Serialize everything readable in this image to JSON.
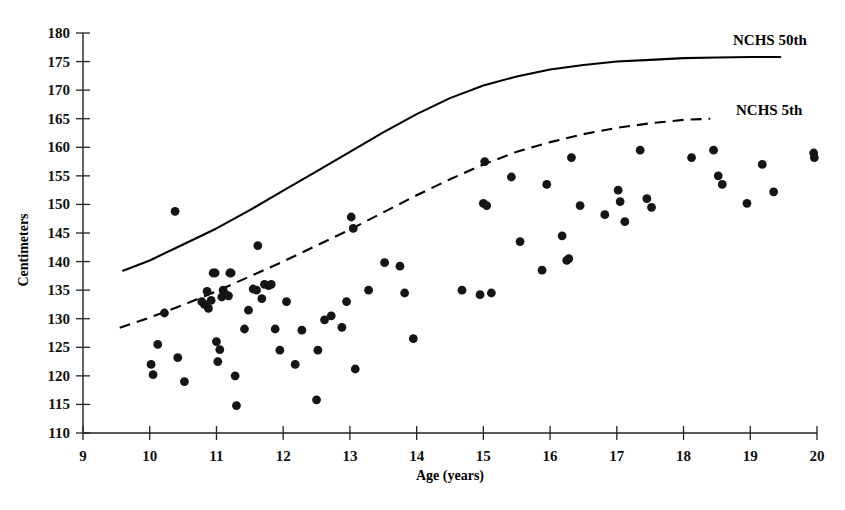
{
  "chart_data": {
    "type": "scatter",
    "title": "",
    "xlabel": "Age (years)",
    "ylabel": "Centimeters",
    "xlim": [
      9,
      20
    ],
    "ylim": [
      110,
      180
    ],
    "xticks": [
      9,
      10,
      11,
      12,
      13,
      14,
      15,
      16,
      17,
      18,
      19,
      20
    ],
    "yticks": [
      110,
      115,
      120,
      125,
      130,
      135,
      140,
      145,
      150,
      155,
      160,
      165,
      170,
      175,
      180
    ],
    "grid": false,
    "legend_position": "inline-right-end-of-curve",
    "marker_color": "#151515",
    "line_color": "#000000",
    "series": [
      {
        "name": "Subjects",
        "type": "scatter",
        "points": [
          [
            10.02,
            122.0
          ],
          [
            10.05,
            120.2
          ],
          [
            10.12,
            125.5
          ],
          [
            10.22,
            131.0
          ],
          [
            10.38,
            148.8
          ],
          [
            10.42,
            123.2
          ],
          [
            10.52,
            119.0
          ],
          [
            10.78,
            133.0
          ],
          [
            10.82,
            132.5
          ],
          [
            10.86,
            134.8
          ],
          [
            10.88,
            131.8
          ],
          [
            10.92,
            133.2
          ],
          [
            10.95,
            138.0
          ],
          [
            10.98,
            138.0
          ],
          [
            11.0,
            126.0
          ],
          [
            11.02,
            122.5
          ],
          [
            11.05,
            124.6
          ],
          [
            11.08,
            133.8
          ],
          [
            11.1,
            135.0
          ],
          [
            11.14,
            134.2
          ],
          [
            11.18,
            134.0
          ],
          [
            11.2,
            138.0
          ],
          [
            11.22,
            138.0
          ],
          [
            11.28,
            120.0
          ],
          [
            11.3,
            114.8
          ],
          [
            11.42,
            128.2
          ],
          [
            11.48,
            131.5
          ],
          [
            11.55,
            135.2
          ],
          [
            11.6,
            135.0
          ],
          [
            11.62,
            142.8
          ],
          [
            11.68,
            133.5
          ],
          [
            11.72,
            136.0
          ],
          [
            11.78,
            135.8
          ],
          [
            11.82,
            136.0
          ],
          [
            11.88,
            128.2
          ],
          [
            11.95,
            124.5
          ],
          [
            12.05,
            133.0
          ],
          [
            12.18,
            122.0
          ],
          [
            12.28,
            128.0
          ],
          [
            12.5,
            115.8
          ],
          [
            12.52,
            124.5
          ],
          [
            12.62,
            129.8
          ],
          [
            12.72,
            130.5
          ],
          [
            12.88,
            128.5
          ],
          [
            12.95,
            133.0
          ],
          [
            13.02,
            147.8
          ],
          [
            13.05,
            145.8
          ],
          [
            13.08,
            121.2
          ],
          [
            13.28,
            135.0
          ],
          [
            13.52,
            139.8
          ],
          [
            13.75,
            139.2
          ],
          [
            13.82,
            134.5
          ],
          [
            13.95,
            126.5
          ],
          [
            14.68,
            135.0
          ],
          [
            14.95,
            134.2
          ],
          [
            15.0,
            150.2
          ],
          [
            15.02,
            157.5
          ],
          [
            15.05,
            149.8
          ],
          [
            15.12,
            134.5
          ],
          [
            15.42,
            154.8
          ],
          [
            15.55,
            143.5
          ],
          [
            15.88,
            138.5
          ],
          [
            15.95,
            153.5
          ],
          [
            16.18,
            144.5
          ],
          [
            16.25,
            140.2
          ],
          [
            16.28,
            140.5
          ],
          [
            16.32,
            158.2
          ],
          [
            16.45,
            149.8
          ],
          [
            16.82,
            148.2
          ],
          [
            17.02,
            152.5
          ],
          [
            17.05,
            150.5
          ],
          [
            17.12,
            147.0
          ],
          [
            17.35,
            159.5
          ],
          [
            17.45,
            151.0
          ],
          [
            17.52,
            149.5
          ],
          [
            18.12,
            158.2
          ],
          [
            18.45,
            159.5
          ],
          [
            18.52,
            155.0
          ],
          [
            18.58,
            153.5
          ],
          [
            18.95,
            150.2
          ],
          [
            19.18,
            157.0
          ],
          [
            19.35,
            152.2
          ],
          [
            19.95,
            159.0
          ],
          [
            19.96,
            158.2
          ]
        ]
      },
      {
        "name": "NCHS 50th",
        "type": "line",
        "style": "solid",
        "label": "NCHS 50th",
        "points": [
          [
            9.6,
            138.4
          ],
          [
            10.0,
            140.2
          ],
          [
            10.5,
            143.0
          ],
          [
            11.0,
            145.8
          ],
          [
            11.5,
            149.0
          ],
          [
            12.0,
            152.4
          ],
          [
            12.5,
            155.8
          ],
          [
            13.0,
            159.2
          ],
          [
            13.5,
            162.6
          ],
          [
            14.0,
            165.8
          ],
          [
            14.5,
            168.6
          ],
          [
            15.0,
            170.8
          ],
          [
            15.5,
            172.4
          ],
          [
            16.0,
            173.6
          ],
          [
            16.5,
            174.4
          ],
          [
            17.0,
            175.0
          ],
          [
            17.5,
            175.3
          ],
          [
            18.0,
            175.6
          ],
          [
            18.5,
            175.7
          ],
          [
            19.0,
            175.8
          ],
          [
            19.45,
            175.8
          ]
        ]
      },
      {
        "name": "NCHS 5th",
        "type": "line",
        "style": "dashed",
        "label": "NCHS 5th",
        "points": [
          [
            9.55,
            128.4
          ],
          [
            10.0,
            130.2
          ],
          [
            10.5,
            132.4
          ],
          [
            11.0,
            134.8
          ],
          [
            11.5,
            137.4
          ],
          [
            12.0,
            140.0
          ],
          [
            12.5,
            142.8
          ],
          [
            13.0,
            145.6
          ],
          [
            13.5,
            148.6
          ],
          [
            14.0,
            151.6
          ],
          [
            14.5,
            154.4
          ],
          [
            15.0,
            157.0
          ],
          [
            15.5,
            159.2
          ],
          [
            16.0,
            160.9
          ],
          [
            16.5,
            162.3
          ],
          [
            17.0,
            163.4
          ],
          [
            17.5,
            164.2
          ],
          [
            18.0,
            164.8
          ],
          [
            18.4,
            165.0
          ]
        ]
      }
    ]
  },
  "axes": {
    "y_title": "Centimeters",
    "x_title": "Age (years)"
  },
  "labels": {
    "nchs_50th": "NCHS 50th",
    "nchs_5th": "NCHS 5th"
  }
}
